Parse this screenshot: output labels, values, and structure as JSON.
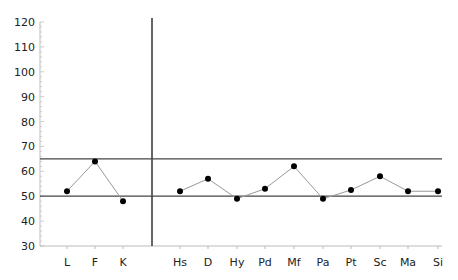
{
  "chart_data": {
    "type": "line",
    "title": "",
    "xlabel": "",
    "ylabel": "",
    "ylim": [
      30,
      120
    ],
    "yticks": [
      30,
      40,
      50,
      60,
      70,
      80,
      90,
      100,
      110,
      120
    ],
    "reference_lines": [
      50,
      65
    ],
    "groups": [
      {
        "name": "validity",
        "categories": [
          "L",
          "F",
          "K"
        ],
        "values": [
          52,
          64,
          48
        ]
      },
      {
        "name": "clinical",
        "categories": [
          "Hs",
          "D",
          "Hy",
          "Pd",
          "Mf",
          "Pa",
          "Pt",
          "Sc",
          "Ma",
          "Si"
        ],
        "values": [
          52,
          57,
          49,
          53,
          62,
          49,
          52.5,
          58,
          52,
          52
        ]
      }
    ],
    "grid": false,
    "legend": "none"
  }
}
